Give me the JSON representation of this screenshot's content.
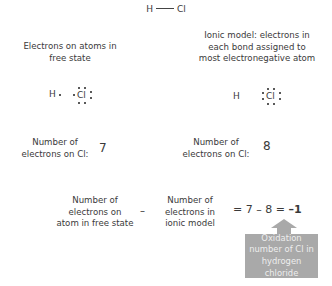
{
  "formula": {
    "left_atom": "H",
    "right_atom": "Cl"
  },
  "left_panel": {
    "heading": [
      "Electrons on atoms in",
      "free state"
    ],
    "h_label": "H",
    "cl_label": "Cl",
    "cl_dots": 7,
    "count_label": [
      "Number of",
      "electrons on Cl:"
    ],
    "count_value": "7"
  },
  "right_panel": {
    "heading": [
      "Ionic model: electrons in",
      "each bond assigned to",
      "most electronegative atom"
    ],
    "h_label": "H",
    "cl_label": "Cl",
    "cl_dots": 8,
    "count_label": [
      "Number of",
      "electrons on Cl:"
    ],
    "count_value": "8"
  },
  "equation": {
    "term1": [
      "Number of",
      "electrons on",
      "atom in free state"
    ],
    "operator": "–",
    "term2": [
      "Number of",
      "electrons in",
      "ionic model"
    ],
    "expression": "= 7 – 8 = ",
    "result": "–1"
  },
  "callout": {
    "lines": [
      "Oxidation",
      "number of Cl in",
      "hydrogen chloride"
    ],
    "color": "#a9a9a9",
    "text_color": "#eeeeee"
  }
}
